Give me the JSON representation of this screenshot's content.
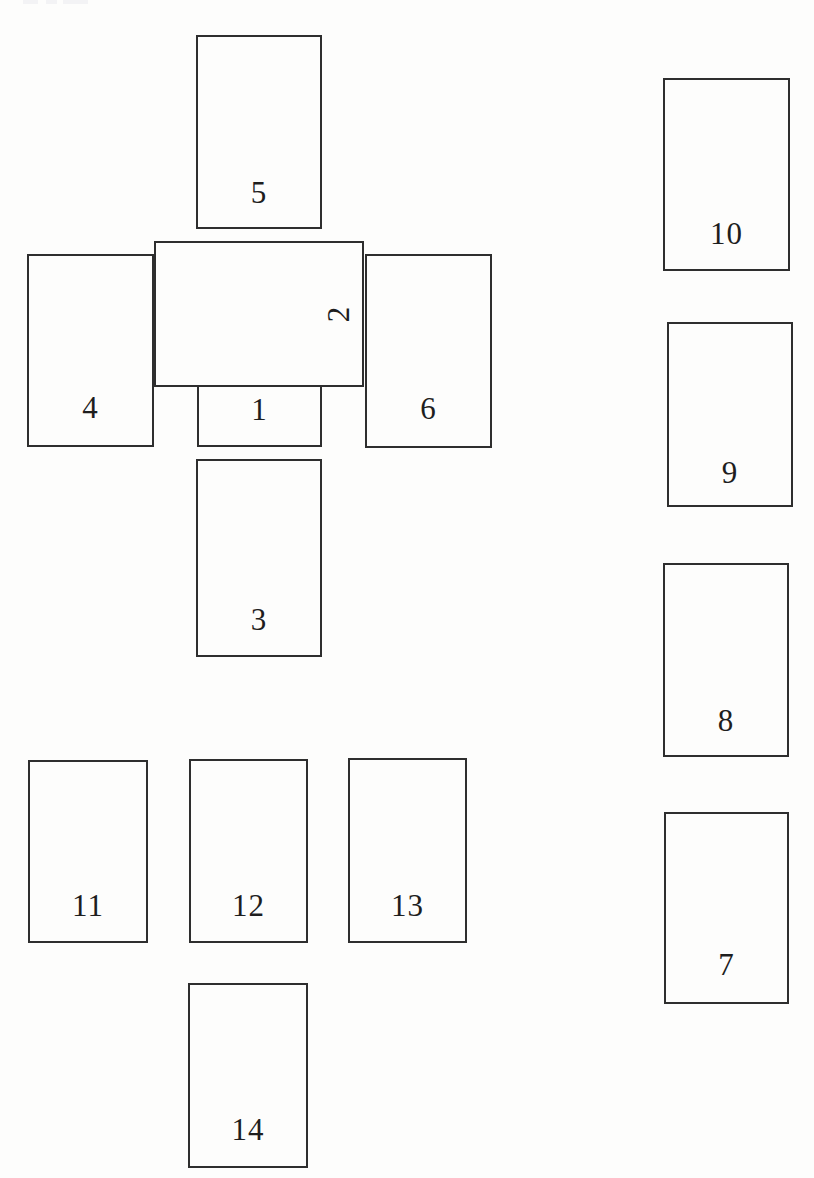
{
  "meta": {
    "width": 814,
    "height": 1178,
    "page_background": "#fdfdfc"
  },
  "figure": {
    "type": "card-spread-layout-diagram",
    "card_border_color": "#2e2e2e",
    "card_fill_color": "#fdfdfc",
    "number_color": "#1e1e1e",
    "artifact_color": "#f3f3f5"
  },
  "cards": [
    {
      "number": "1",
      "x": 197,
      "y": 296,
      "w": 125,
      "h": 151,
      "z": 1,
      "orientation": "vertical",
      "label_rotation": 0,
      "label_bottom": 20
    },
    {
      "number": "2",
      "x": 154,
      "y": 241,
      "w": 210,
      "h": 146,
      "z": 2,
      "orientation": "horizontal",
      "label_rotation": -90,
      "label_right": 14
    },
    {
      "number": "3",
      "x": 196,
      "y": 459,
      "w": 126,
      "h": 198,
      "z": 1,
      "orientation": "vertical",
      "label_rotation": 0,
      "label_bottom": 20
    },
    {
      "number": "4",
      "x": 27,
      "y": 254,
      "w": 127,
      "h": 193,
      "z": 1,
      "orientation": "vertical",
      "label_rotation": 0,
      "label_bottom": 22
    },
    {
      "number": "5",
      "x": 196,
      "y": 35,
      "w": 126,
      "h": 194,
      "z": 1,
      "orientation": "vertical",
      "label_rotation": 0,
      "label_bottom": 19
    },
    {
      "number": "6",
      "x": 365,
      "y": 254,
      "w": 127,
      "h": 194,
      "z": 1,
      "orientation": "vertical",
      "label_rotation": 0,
      "label_bottom": 22
    },
    {
      "number": "7",
      "x": 664,
      "y": 812,
      "w": 125,
      "h": 192,
      "z": 1,
      "orientation": "vertical",
      "label_rotation": 0,
      "label_bottom": 22
    },
    {
      "number": "8",
      "x": 663,
      "y": 563,
      "w": 126,
      "h": 194,
      "z": 1,
      "orientation": "vertical",
      "label_rotation": 0,
      "label_bottom": 19
    },
    {
      "number": "9",
      "x": 667,
      "y": 322,
      "w": 126,
      "h": 185,
      "z": 1,
      "orientation": "vertical",
      "label_rotation": 0,
      "label_bottom": 17
    },
    {
      "number": "10",
      "x": 663,
      "y": 78,
      "w": 127,
      "h": 193,
      "z": 1,
      "orientation": "vertical",
      "label_rotation": 0,
      "label_bottom": 20
    },
    {
      "number": "11",
      "x": 28,
      "y": 760,
      "w": 120,
      "h": 183,
      "z": 1,
      "orientation": "vertical",
      "label_rotation": 0,
      "label_bottom": 20
    },
    {
      "number": "12",
      "x": 189,
      "y": 759,
      "w": 119,
      "h": 184,
      "z": 1,
      "orientation": "vertical",
      "label_rotation": 0,
      "label_bottom": 20
    },
    {
      "number": "13",
      "x": 348,
      "y": 758,
      "w": 119,
      "h": 185,
      "z": 1,
      "orientation": "vertical",
      "label_rotation": 0,
      "label_bottom": 20
    },
    {
      "number": "14",
      "x": 188,
      "y": 983,
      "w": 120,
      "h": 185,
      "z": 1,
      "orientation": "vertical",
      "label_rotation": 0,
      "label_bottom": 21
    }
  ],
  "page_edge_artifacts": [
    {
      "x": 23,
      "y": 0,
      "w": 15,
      "h": 4
    },
    {
      "x": 46,
      "y": 0,
      "w": 11,
      "h": 4
    },
    {
      "x": 63,
      "y": 0,
      "w": 25,
      "h": 4
    }
  ]
}
